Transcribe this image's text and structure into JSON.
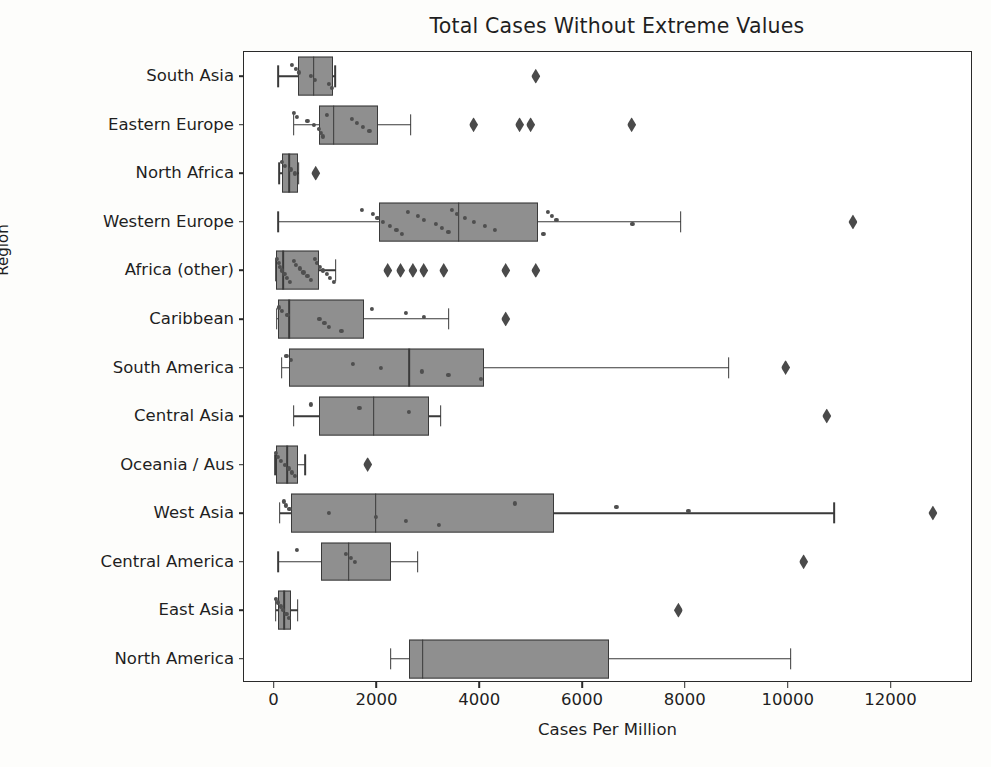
{
  "chart_data": {
    "type": "box",
    "title": "Total Cases Without Extreme Values",
    "xlabel": "Cases Per Million",
    "ylabel": "Region",
    "xlim": [
      -595,
      13585
    ],
    "xticks": [
      0,
      2000,
      4000,
      6000,
      8000,
      10000,
      12000
    ],
    "xtick_labels": [
      "0",
      "2000",
      "4000",
      "6000",
      "8000",
      "10000",
      "12000"
    ],
    "grid": false,
    "legend": null,
    "orientation": "horizontal",
    "box_facecolor": "#8f8f8f",
    "box_edgecolor": "#3a3a3a",
    "flier_marker": "diamond",
    "categories": [
      "South Asia",
      "Eastern Europe",
      "North Africa",
      "Western Europe",
      "Africa (other)",
      "Caribbean",
      "South America",
      "Central Asia",
      "Oceania / Aus",
      "West Asia",
      "Central America",
      "East Asia",
      "North America"
    ],
    "boxes": [
      {
        "category": "South Asia",
        "whisker_low": 75,
        "q1": 450,
        "median": 760,
        "q3": 1130,
        "whisker_high": 1180,
        "fliers": [
          5080
        ],
        "points": [
          330,
          420,
          470,
          700,
          780,
          1060,
          1120
        ]
      },
      {
        "category": "Eastern Europe",
        "whisker_low": 370,
        "q1": 860,
        "median": 1150,
        "q3": 2005,
        "whisker_high": 2645,
        "fliers": [
          3870,
          4765,
          4980,
          6945
        ],
        "points": [
          380,
          430,
          640,
          760,
          860,
          900,
          940,
          1010,
          1500,
          1600,
          1720,
          1845
        ]
      },
      {
        "category": "North Africa",
        "whisker_low": 95,
        "q1": 140,
        "median": 290,
        "q3": 450,
        "whisker_high": 470,
        "fliers": [
          800
        ],
        "points": [
          150,
          200,
          310,
          400
        ]
      },
      {
        "category": "Western Europe",
        "whisker_low": 75,
        "q1": 2030,
        "median": 3580,
        "q3": 5120,
        "whisker_high": 7900,
        "fliers": [
          11250
        ],
        "points": [
          1700,
          1905,
          2000,
          2100,
          2245,
          2370,
          2480,
          2600,
          2780,
          2900,
          3130,
          3260,
          3380,
          3450,
          3550,
          3700,
          3880,
          4090,
          4290,
          5230,
          5320,
          5390,
          5480,
          6960
        ]
      },
      {
        "category": "Africa (other)",
        "whisker_low": 20,
        "q1": 30,
        "median": 170,
        "q3": 860,
        "whisker_high": 1185,
        "fliers": [
          2200,
          2450,
          2690,
          2900,
          3290,
          4495,
          5080
        ],
        "points": [
          40,
          80,
          110,
          150,
          190,
          240,
          300,
          370,
          420,
          500,
          560,
          640,
          700,
          780,
          830,
          880,
          940,
          1010,
          1080,
          1150
        ]
      },
      {
        "category": "Caribbean",
        "whisker_low": 40,
        "q1": 60,
        "median": 290,
        "q3": 1730,
        "whisker_high": 3385,
        "fliers": [
          4495
        ],
        "points": [
          90,
          150,
          250,
          870,
          970,
          1060,
          1300,
          1900,
          2560,
          2900
        ]
      },
      {
        "category": "South America",
        "whisker_low": 140,
        "q1": 290,
        "median": 2620,
        "q3": 4065,
        "whisker_high": 8830,
        "fliers": [
          9940
        ],
        "points": [
          230,
          320,
          1520,
          2070,
          2860,
          3380,
          4010
        ]
      },
      {
        "category": "Central Asia",
        "whisker_low": 370,
        "q1": 860,
        "median": 1930,
        "q3": 2995,
        "whisker_high": 3230,
        "fliers": [
          10740
        ],
        "points": [
          700,
          1650,
          2620
        ]
      },
      {
        "category": "Oceania / Aus",
        "whisker_low": 10,
        "q1": 30,
        "median": 240,
        "q3": 450,
        "whisker_high": 600,
        "fliers": [
          1810
        ],
        "points": [
          20,
          60,
          130,
          200,
          280,
          330,
          400
        ]
      },
      {
        "category": "West Asia",
        "whisker_low": 100,
        "q1": 310,
        "median": 1965,
        "q3": 5430,
        "whisker_high": 10880,
        "fliers": [
          12805
        ],
        "points": [
          180,
          220,
          290,
          1060,
          1965,
          2560,
          3200,
          4680,
          6650,
          8050
        ]
      },
      {
        "category": "Central America",
        "whisker_low": 75,
        "q1": 895,
        "median": 1440,
        "q3": 2260,
        "whisker_high": 2785,
        "fliers": [
          10290
        ],
        "points": [
          430,
          1380,
          1480,
          1560
        ]
      },
      {
        "category": "East Asia",
        "whisker_low": 20,
        "q1": 60,
        "median": 180,
        "q3": 310,
        "whisker_high": 450,
        "fliers": [
          7855
        ],
        "points": [
          30,
          70,
          120,
          160,
          230,
          280
        ]
      },
      {
        "category": "North America",
        "whisker_low": 2260,
        "q1": 2610,
        "median": 2880,
        "q3": 6500,
        "whisker_high": 10040,
        "fliers": [],
        "points": []
      }
    ]
  }
}
